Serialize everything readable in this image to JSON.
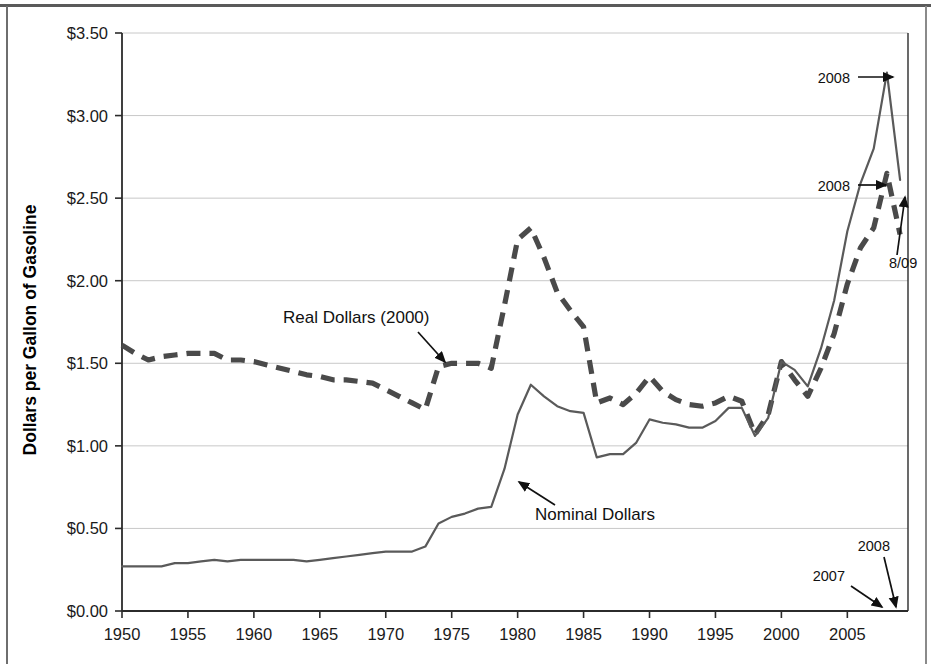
{
  "chart_data": {
    "type": "line",
    "title": "",
    "xlabel": "",
    "ylabel": "Dollars per Gallon of Gasoline",
    "xlim": [
      1950,
      2009.6
    ],
    "ylim": [
      0,
      3.5
    ],
    "grid": true,
    "legend_position": "inline-annotations",
    "y_tick_labels": [
      "$3.50",
      "$3.00",
      "$2.50",
      "$2.00",
      "$1.50",
      "$1.00",
      "$0.50",
      "$0.00"
    ],
    "y_tick_values": [
      3.5,
      3.0,
      2.5,
      2.0,
      1.5,
      1.0,
      0.5,
      0.0
    ],
    "x_tick_labels": [
      "1950",
      "1955",
      "1960",
      "1965",
      "1970",
      "1975",
      "1980",
      "1985",
      "1990",
      "1995",
      "2000",
      "2005"
    ],
    "x_tick_values": [
      1950,
      1955,
      1960,
      1965,
      1970,
      1975,
      1980,
      1985,
      1990,
      1995,
      2000,
      2005
    ],
    "series": [
      {
        "name": "Real Dollars (2000)",
        "style": "dashed",
        "color": "#4a4a4a",
        "x": [
          1950,
          1951,
          1952,
          1953,
          1954,
          1955,
          1956,
          1957,
          1958,
          1959,
          1960,
          1961,
          1962,
          1963,
          1964,
          1965,
          1966,
          1967,
          1968,
          1969,
          1970,
          1971,
          1972,
          1973,
          1974,
          1975,
          1976,
          1977,
          1978,
          1979,
          1980,
          1981,
          1982,
          1983,
          1984,
          1985,
          1986,
          1987,
          1988,
          1989,
          1990,
          1991,
          1992,
          1993,
          1994,
          1995,
          1996,
          1997,
          1998,
          1999,
          2000,
          2001,
          2002,
          2003,
          2004,
          2005,
          2006,
          2007,
          2008,
          2009
        ],
        "values": [
          1.61,
          1.56,
          1.52,
          1.54,
          1.55,
          1.56,
          1.56,
          1.56,
          1.52,
          1.52,
          1.51,
          1.49,
          1.47,
          1.45,
          1.43,
          1.42,
          1.4,
          1.4,
          1.39,
          1.38,
          1.34,
          1.3,
          1.26,
          1.22,
          1.48,
          1.5,
          1.5,
          1.5,
          1.47,
          1.85,
          2.25,
          2.32,
          2.14,
          1.93,
          1.82,
          1.72,
          1.26,
          1.29,
          1.25,
          1.32,
          1.42,
          1.33,
          1.28,
          1.25,
          1.24,
          1.26,
          1.3,
          1.27,
          1.07,
          1.19,
          1.51,
          1.4,
          1.3,
          1.47,
          1.68,
          1.98,
          2.2,
          2.32,
          2.65,
          2.28
        ]
      },
      {
        "name": "Nominal Dollars",
        "style": "solid",
        "color": "#5a5a5a",
        "x": [
          1950,
          1951,
          1952,
          1953,
          1954,
          1955,
          1956,
          1957,
          1958,
          1959,
          1960,
          1961,
          1962,
          1963,
          1964,
          1965,
          1966,
          1967,
          1968,
          1969,
          1970,
          1971,
          1972,
          1973,
          1974,
          1975,
          1976,
          1977,
          1978,
          1979,
          1980,
          1981,
          1982,
          1983,
          1984,
          1985,
          1986,
          1987,
          1988,
          1989,
          1990,
          1991,
          1992,
          1993,
          1994,
          1995,
          1996,
          1997,
          1998,
          1999,
          2000,
          2001,
          2002,
          2003,
          2004,
          2005,
          2006,
          2007,
          2008,
          2009
        ],
        "values": [
          0.27,
          0.27,
          0.27,
          0.27,
          0.29,
          0.29,
          0.3,
          0.31,
          0.3,
          0.31,
          0.31,
          0.31,
          0.31,
          0.31,
          0.3,
          0.31,
          0.32,
          0.33,
          0.34,
          0.35,
          0.36,
          0.36,
          0.36,
          0.39,
          0.53,
          0.57,
          0.59,
          0.62,
          0.63,
          0.86,
          1.19,
          1.37,
          1.3,
          1.24,
          1.21,
          1.2,
          0.93,
          0.95,
          0.95,
          1.02,
          1.16,
          1.14,
          1.13,
          1.11,
          1.11,
          1.15,
          1.23,
          1.23,
          1.06,
          1.17,
          1.51,
          1.46,
          1.36,
          1.59,
          1.88,
          2.3,
          2.59,
          2.8,
          3.26,
          2.61
        ]
      }
    ],
    "annotations": [
      {
        "id": "real-dollars-label",
        "text": "Real Dollars (2000)",
        "points_to_series": "Real Dollars (2000)",
        "points_to_year": 1973
      },
      {
        "id": "nominal-dollars-label",
        "text": "Nominal Dollars",
        "points_to_series": "Nominal Dollars",
        "points_to_year": 1979
      },
      {
        "id": "nominal-2008-peak",
        "text": "2008",
        "points_to_series": "Nominal Dollars",
        "points_to_year": 2008,
        "value": 3.26
      },
      {
        "id": "real-2008-peak",
        "text": "2008",
        "points_to_series": "Real Dollars (2000)",
        "points_to_year": 2008,
        "value": 2.65
      },
      {
        "id": "aug-2009",
        "text": "8/09",
        "points_to_series": "Nominal Dollars",
        "points_to_year": 2009,
        "value": 2.61
      },
      {
        "id": "axis-2007",
        "text": "2007",
        "points_to_axis_year": 2007
      },
      {
        "id": "axis-2008",
        "text": "2008",
        "points_to_axis_year": 2008
      }
    ]
  },
  "colors": {
    "axis": "#2b2b2b",
    "grid": "#c8c8c8",
    "plot_background": "#ffffff",
    "real_series": "#4a4a4a",
    "nominal_series": "#5a5a5a",
    "text": "#111111"
  }
}
